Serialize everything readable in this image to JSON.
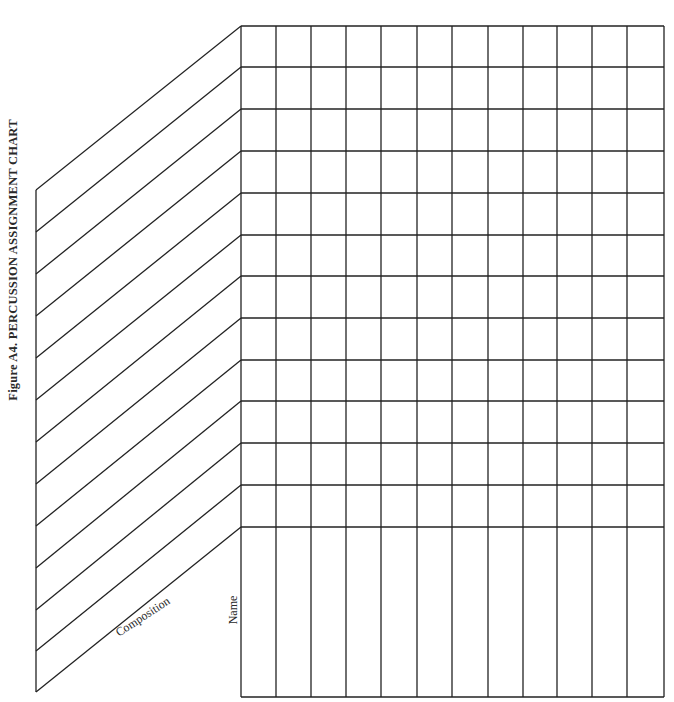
{
  "figure": {
    "title": "Figure A4.  PERCUSSION ASSIGNMENT CHART"
  },
  "labels": {
    "composition": "Composition",
    "name": "Name"
  },
  "grid": {
    "columns": 12,
    "composition_rows": 12,
    "line_color": "#222222",
    "column_x": [
      241,
      276,
      311,
      346,
      381,
      417,
      452,
      488,
      523,
      557,
      592,
      627,
      664
    ],
    "row_y": [
      26,
      67,
      109,
      151,
      193,
      235,
      276,
      318,
      360,
      401,
      443,
      485,
      527
    ],
    "bottom_y": 697,
    "slant_left_x": 36,
    "slant_left_y": [
      190,
      232,
      274,
      316,
      358,
      400,
      442,
      484,
      526,
      568,
      610,
      651,
      692
    ]
  },
  "chart_data": {
    "type": "table",
    "title": "Figure A4. PERCUSSION ASSIGNMENT CHART",
    "row_header_label": "Composition",
    "column_header_label": "Name",
    "num_columns": 12,
    "num_rows": 12,
    "cells": "blank"
  }
}
